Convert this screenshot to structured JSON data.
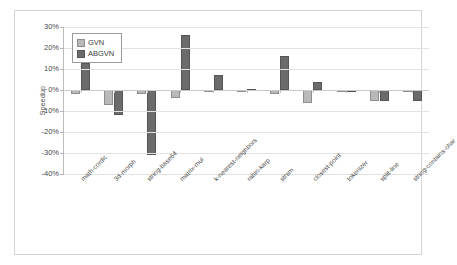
{
  "chart_data": {
    "type": "bar",
    "title": "",
    "xlabel": "",
    "ylabel": "Speedup",
    "ylim": [
      -40,
      30
    ],
    "ytick_labels": [
      "30%",
      "20%",
      "10%",
      "0%",
      "-10%",
      "-20%",
      "-30%",
      "-40%"
    ],
    "ytick_values": [
      30,
      20,
      10,
      0,
      -10,
      -20,
      -30,
      -40
    ],
    "grid": true,
    "legend_position": "top-left",
    "categories": [
      "math-cordic",
      "3d-morph",
      "string-base64",
      "matrix-mul",
      "k-nearest-neighbors",
      "rabin-karp",
      "strsm",
      "closest-point",
      "tokenizer",
      "split-line",
      "string-contains-char"
    ],
    "series": [
      {
        "name": "GVN",
        "color": "#b9b9b9",
        "values": [
          -2,
          -7,
          -2,
          -4,
          -1,
          -1,
          -2,
          -6,
          -0.5,
          -5,
          -1
        ]
      },
      {
        "name": "ABGVN",
        "color": "#6b6b6b",
        "values": [
          13,
          -12,
          -31,
          26,
          7,
          0.5,
          16,
          4,
          -0.5,
          -5,
          -5
        ]
      }
    ]
  }
}
